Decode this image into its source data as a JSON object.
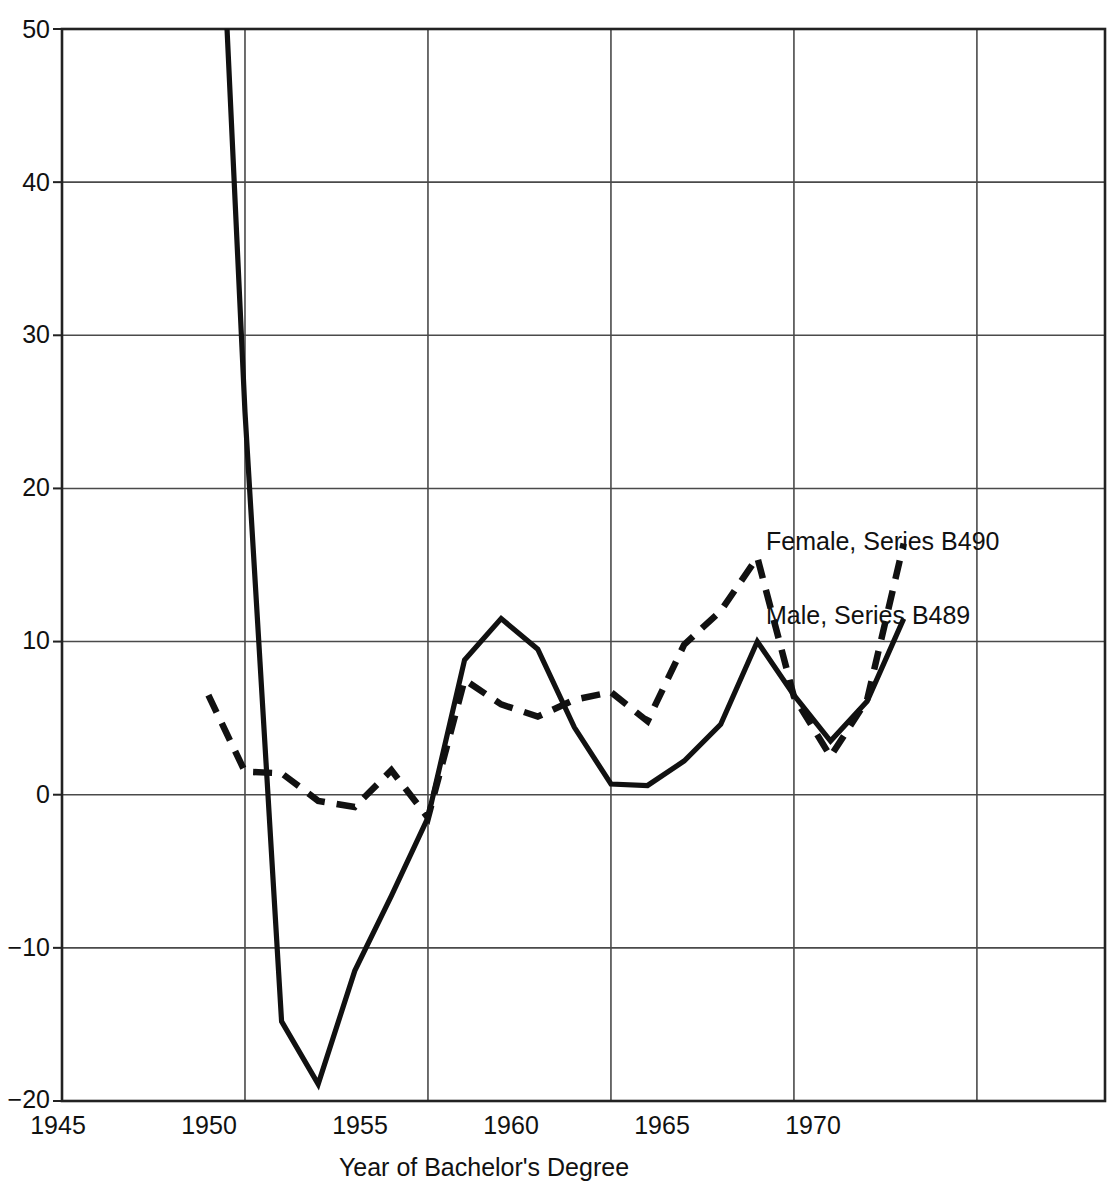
{
  "chart_data": {
    "type": "line",
    "title": "",
    "subtitle": "",
    "xlabel": "Year of Bachelor's Degree",
    "ylabel": "",
    "xlim": [
      1945,
      1973.5
    ],
    "ylim": [
      -20,
      50
    ],
    "xticks": [
      1945,
      1950,
      1955,
      1960,
      1965,
      1970
    ],
    "xtick_labels": [
      "1945",
      "1950",
      "1955",
      "1960",
      "1965",
      "1970"
    ],
    "yticks": [
      -20,
      -10,
      0,
      10,
      20,
      30,
      40,
      50
    ],
    "ytick_labels": [
      "−20",
      "−10",
      "0",
      "10",
      "20",
      "30",
      "40",
      "50"
    ],
    "grid": true,
    "grid_color": "#4a4a4a",
    "legend_position": "inline-right",
    "line_color": "#111111",
    "series": [
      {
        "name": "Male, Series B489",
        "label": "Male, Series B489",
        "style": "solid",
        "label_x": 1968.6,
        "label_y": 11.6,
        "x": [
          1949,
          1950,
          1951,
          1952,
          1953,
          1954,
          1955,
          1956,
          1957,
          1958,
          1959,
          1960,
          1961,
          1962,
          1963,
          1964,
          1965,
          1966,
          1967,
          1968
        ],
        "values": [
          76,
          25.0,
          -14.8,
          -18.9,
          -11.5,
          -6.6,
          -1.5,
          8.8,
          11.5,
          9.5,
          4.4,
          0.7,
          0.6,
          2.2,
          4.6,
          10.0,
          6.5,
          3.5,
          6.1,
          11.5
        ]
      },
      {
        "name": "Female, Series B490",
        "label": "Female, Series B490",
        "style": "dashed",
        "label_x": 1968.6,
        "label_y": 16.4,
        "x": [
          1949,
          1950,
          1951,
          1952,
          1953,
          1954,
          1955,
          1956,
          1957,
          1958,
          1959,
          1960,
          1961,
          1962,
          1963,
          1964,
          1965,
          1966,
          1967,
          1968
        ],
        "values": [
          6.5,
          1.5,
          1.4,
          -0.4,
          -0.8,
          1.6,
          -1.5,
          7.5,
          5.9,
          5.1,
          6.2,
          6.7,
          4.8,
          9.8,
          12.0,
          15.5,
          6.4,
          2.5,
          6.2,
          16.4
        ]
      }
    ]
  }
}
